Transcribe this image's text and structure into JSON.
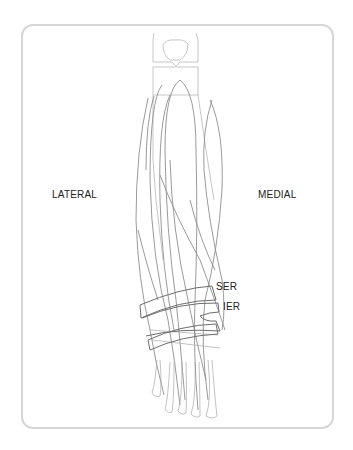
{
  "figure": {
    "labels": {
      "lateral": "LATERAL",
      "medial": "MEDIAL",
      "ser": "SER",
      "ier": "IER"
    },
    "colors": {
      "frame": "#d6d6d6",
      "bone_outline": "#b5b5b5",
      "tendon": "#8c8c8c",
      "retinaculum": "#6e6e6e",
      "text": "#222222"
    }
  }
}
